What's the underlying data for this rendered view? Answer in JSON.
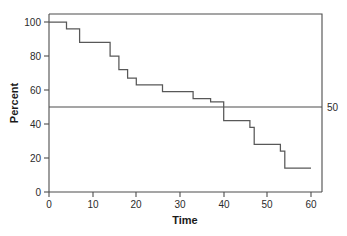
{
  "chart_data": {
    "type": "line",
    "subtype": "step-function survival curve",
    "title": "",
    "xlabel": "Time",
    "ylabel": "Percent",
    "xlim": [
      0,
      63
    ],
    "ylim": [
      0,
      105
    ],
    "xticks": [
      0,
      10,
      20,
      30,
      40,
      50,
      60
    ],
    "xtick_labels": [
      "0",
      "10",
      "20",
      "30",
      "40",
      "50",
      "60"
    ],
    "yticks": [
      0,
      20,
      40,
      60,
      80,
      100
    ],
    "ytick_labels": [
      "0",
      "20",
      "40",
      "60",
      "80",
      "100"
    ],
    "grid": false,
    "legend": false,
    "reference_lines": [
      {
        "name": "median-reference-line",
        "orientation": "horizontal",
        "value": 50,
        "label": "50"
      }
    ],
    "series": [
      {
        "name": "survival",
        "step": "post",
        "x": [
          0,
          4,
          7,
          14,
          16,
          18,
          20,
          26,
          33,
          37,
          40,
          46,
          47,
          53,
          54,
          60
        ],
        "y": [
          100,
          96,
          88,
          80,
          72,
          67,
          63,
          59,
          55,
          53,
          42,
          38,
          28,
          24,
          14,
          14
        ]
      }
    ],
    "annotations": []
  },
  "figure": {
    "caption": ""
  }
}
